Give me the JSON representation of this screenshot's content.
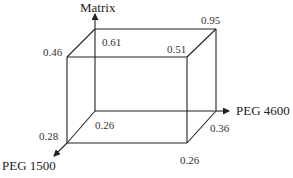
{
  "diagram": {
    "type": "3d-cube",
    "axes": {
      "vertical": "Matrix",
      "depth": "PEG 1500",
      "horizontal": "PEG 4600"
    },
    "vertices": {
      "front_top_left": "0.46",
      "back_top_left": "0.61",
      "front_top_right": "0.51",
      "back_top_right": "0.95",
      "front_bottom_left": "0.28",
      "back_bottom_left": "0.26",
      "back_bottom_right": "0.36",
      "front_bottom_right": "0.26"
    }
  }
}
